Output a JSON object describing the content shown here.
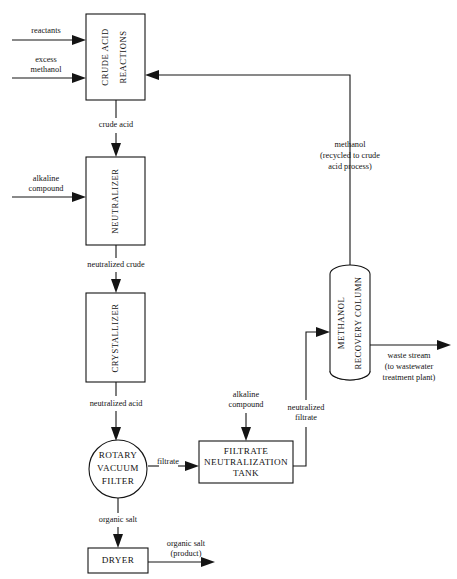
{
  "diagram": {
    "type": "process-flow-diagram",
    "background_color": "#ffffff",
    "line_color": "#141414",
    "units": [
      {
        "id": "crude-acid-reactions",
        "shape": "rectangle",
        "orientation": "vertical-text",
        "lines": [
          "CRUDE ACID",
          "REACTIONS"
        ]
      },
      {
        "id": "neutralizer",
        "shape": "rectangle",
        "orientation": "vertical-text",
        "lines": [
          "NEUTRALIZER"
        ]
      },
      {
        "id": "crystallizer",
        "shape": "rectangle",
        "orientation": "vertical-text",
        "lines": [
          "CRYSTALLIZER"
        ]
      },
      {
        "id": "rotary-vacuum-filter",
        "shape": "circle",
        "orientation": "horizontal-text",
        "lines": [
          "ROTARY",
          "VACUUM",
          "FILTER"
        ]
      },
      {
        "id": "filtrate-neutralization-tank",
        "shape": "rectangle",
        "orientation": "horizontal-text",
        "lines": [
          "FILTRATE",
          "NEUTRALIZATION",
          "TANK"
        ]
      },
      {
        "id": "methanol-recovery-column",
        "shape": "vertical-cylinder",
        "orientation": "vertical-text",
        "lines": [
          "METHANOL",
          "RECOVERY COLUMN"
        ]
      },
      {
        "id": "dryer",
        "shape": "rectangle",
        "orientation": "horizontal-text",
        "lines": [
          "DRYER"
        ]
      }
    ],
    "streams": [
      {
        "id": "reactants",
        "lines": [
          "reactants"
        ]
      },
      {
        "id": "excess-methanol",
        "lines": [
          "excess",
          "methanol"
        ]
      },
      {
        "id": "crude-acid",
        "lines": [
          "crude acid"
        ]
      },
      {
        "id": "alkaline-compound-neutralizer",
        "lines": [
          "alkaline",
          "compound"
        ]
      },
      {
        "id": "neutralized-crude",
        "lines": [
          "neutralized crude"
        ]
      },
      {
        "id": "neutralized-acid",
        "lines": [
          "neutralized acid"
        ]
      },
      {
        "id": "filtrate",
        "lines": [
          "filtrate"
        ]
      },
      {
        "id": "organic-salt",
        "lines": [
          "organic salt"
        ]
      },
      {
        "id": "organic-salt-product",
        "lines": [
          "organic salt",
          "(product)"
        ]
      },
      {
        "id": "alkaline-compound-tank",
        "lines": [
          "alkaline",
          "compound"
        ]
      },
      {
        "id": "neutralized-filtrate",
        "lines": [
          "neutralized",
          "filtrate"
        ]
      },
      {
        "id": "methanol-recycle",
        "lines": [
          "methanol",
          "(recycled to crude",
          "acid process)"
        ]
      },
      {
        "id": "waste-stream",
        "lines": [
          "waste stream",
          "(to wastewater",
          "treatment plant)"
        ]
      }
    ],
    "labels": {
      "crude_acid_reactions_l1": "CRUDE ACID",
      "crude_acid_reactions_l2": "REACTIONS",
      "neutralizer": "NEUTRALIZER",
      "crystallizer": "CRYSTALLIZER",
      "rotary_vacuum_filter_l1": "ROTARY",
      "rotary_vacuum_filter_l2": "VACUUM",
      "rotary_vacuum_filter_l3": "FILTER",
      "filtrate_tank_l1": "FILTRATE",
      "filtrate_tank_l2": "NEUTRALIZATION",
      "filtrate_tank_l3": "TANK",
      "methanol_column_l1": "METHANOL",
      "methanol_column_l2": "RECOVERY COLUMN",
      "dryer": "DRYER",
      "reactants": "reactants",
      "excess_l1": "excess",
      "excess_l2": "methanol",
      "crude_acid": "crude acid",
      "alkaline_l1": "alkaline",
      "alkaline_l2": "compound",
      "neutralized_crude": "neutralized crude",
      "neutralized_acid": "neutralized acid",
      "filtrate": "filtrate",
      "organic_salt": "organic salt",
      "organic_salt_product_l1": "organic salt",
      "organic_salt_product_l2": "(product)",
      "alkaline_tank_l1": "alkaline",
      "alkaline_tank_l2": "compound",
      "neutralized_filtrate_l1": "neutralized",
      "neutralized_filtrate_l2": "filtrate",
      "methanol_recycle_l1": "methanol",
      "methanol_recycle_l2": "(recycled to crude",
      "methanol_recycle_l3": "acid process)",
      "waste_l1": "waste stream",
      "waste_l2": "(to wastewater",
      "waste_l3": "treatment plant)"
    }
  }
}
